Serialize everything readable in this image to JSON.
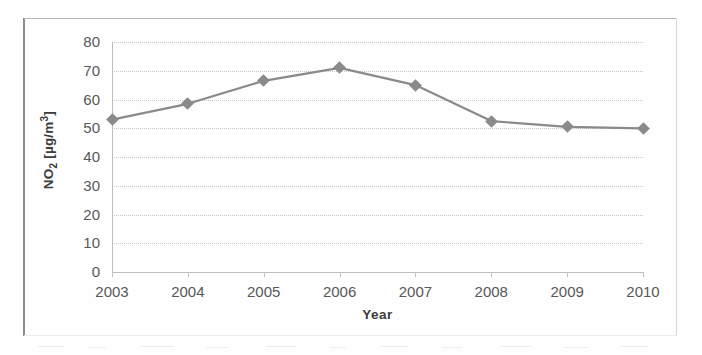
{
  "figure": {
    "background_color": "#ffffff",
    "frame_color": "#8c8c8c"
  },
  "chart_data": {
    "type": "line",
    "title": "",
    "xlabel": "Year",
    "ylabel": "NO2 [µg/m³]",
    "ylabel_plain": "NO2 [ug/m3]",
    "categories": [
      "2003",
      "2004",
      "2005",
      "2006",
      "2007",
      "2008",
      "2009",
      "2010"
    ],
    "values": [
      53,
      58.5,
      66.5,
      71,
      65,
      52.5,
      50.5,
      50
    ],
    "series": [
      {
        "name": "NO2",
        "values": [
          53,
          58.5,
          66.5,
          71,
          65,
          52.5,
          50.5,
          50
        ],
        "line_color": "#8a8a8a",
        "marker": "diamond",
        "marker_color": "#8a8a8a"
      }
    ],
    "ylim": [
      0,
      80
    ],
    "ytick_labels": [
      "80",
      "70",
      "60",
      "50",
      "40",
      "30",
      "20",
      "10",
      "0"
    ],
    "ytick_values": [
      80,
      70,
      60,
      50,
      40,
      30,
      20,
      10,
      0
    ],
    "ytick_step": 10,
    "xtick_labels": [
      "2003",
      "2004",
      "2005",
      "2006",
      "2007",
      "2008",
      "2009",
      "2010"
    ],
    "grid": "horizontal-dotted",
    "grid_color": "#c8c8c8",
    "legend": "none",
    "legend_position": "none",
    "axis_color": "#bdbdbd",
    "tick_label_color": "#58585a",
    "axis_title_color": "#3b3b3b"
  }
}
